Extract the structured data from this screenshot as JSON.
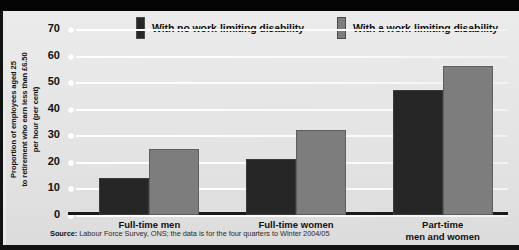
{
  "chart_data": {
    "type": "bar",
    "title": "",
    "xlabel": "",
    "ylabel": "Proportion of employees aged 25 to retirement who earn less than £6.50 per hour (per cent)",
    "ylim": [
      0,
      70
    ],
    "ytick_step": 10,
    "yticks": [
      "70",
      "60",
      "50",
      "40",
      "30",
      "20",
      "10",
      "0"
    ],
    "grid": true,
    "legend_position": "top",
    "categories": [
      "Full-time men",
      "Full-time women",
      "Part-time\nmen and women"
    ],
    "series": [
      {
        "name": "With no work-limiting disability",
        "color": "#262626",
        "values": [
          14,
          21,
          47
        ]
      },
      {
        "name": "With a work-limiting disability",
        "color": "#7d7d7d",
        "values": [
          25,
          32,
          56
        ]
      }
    ],
    "source_prefix": "Source:",
    "source_text": " Labour Force Survey, ONS; the data is for the four quarters to Winter 2004/05"
  },
  "axis": {
    "y_title_line1": "Proportion of employees aged 25",
    "y_title_line2": "to retirement who earn less than £6.50",
    "y_title_line3": "per hour (per cent)"
  }
}
